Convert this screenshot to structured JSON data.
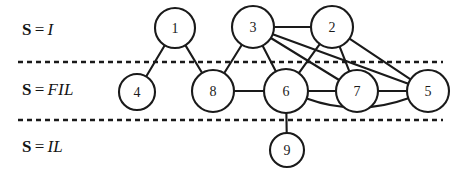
{
  "figure": {
    "type": "graph-diagram",
    "width": 467,
    "height": 173,
    "background_color": "#ffffff",
    "ink_color": "#1a1a1a"
  },
  "bands": [
    {
      "id": "band-i",
      "prefix": "S",
      "equals": "=",
      "value": "I",
      "label_x": 22,
      "label_y": 20
    },
    {
      "id": "band-fil",
      "prefix": "S",
      "equals": "=",
      "value": "FIL",
      "label_x": 22,
      "label_y": 80
    },
    {
      "id": "band-il",
      "prefix": "S",
      "equals": "=",
      "value": "IL",
      "label_x": 22,
      "label_y": 137
    }
  ],
  "dividers": [
    {
      "id": "divider-top",
      "x1": 18,
      "y1": 62,
      "x2": 443,
      "y2": 62
    },
    {
      "id": "divider-bottom",
      "x1": 18,
      "y1": 120,
      "x2": 443,
      "y2": 120
    }
  ],
  "nodes": [
    {
      "id": "1",
      "label": "1",
      "cx": 175,
      "cy": 28,
      "r": 20,
      "band": "band-i"
    },
    {
      "id": "3",
      "label": "3",
      "cx": 253,
      "cy": 27,
      "r": 21,
      "band": "band-i"
    },
    {
      "id": "2",
      "label": "2",
      "cx": 332,
      "cy": 27,
      "r": 21,
      "band": "band-i"
    },
    {
      "id": "4",
      "label": "4",
      "cx": 137,
      "cy": 92,
      "r": 18,
      "band": "band-fil"
    },
    {
      "id": "8",
      "label": "8",
      "cx": 213,
      "cy": 91,
      "r": 21,
      "band": "band-fil"
    },
    {
      "id": "6",
      "label": "6",
      "cx": 286,
      "cy": 91,
      "r": 22,
      "band": "band-fil"
    },
    {
      "id": "7",
      "label": "7",
      "cx": 357,
      "cy": 91,
      "r": 21,
      "band": "band-fil"
    },
    {
      "id": "5",
      "label": "5",
      "cx": 428,
      "cy": 91,
      "r": 21,
      "band": "band-fil"
    },
    {
      "id": "9",
      "label": "9",
      "cx": 287,
      "cy": 150,
      "r": 17,
      "band": "band-il"
    }
  ],
  "edges": [
    {
      "id": "edge-1-4",
      "from": "1",
      "to": "4",
      "shape": "straight"
    },
    {
      "id": "edge-1-8",
      "from": "1",
      "to": "8",
      "shape": "straight"
    },
    {
      "id": "edge-3-2",
      "from": "3",
      "to": "2",
      "shape": "straight"
    },
    {
      "id": "edge-3-8",
      "from": "3",
      "to": "8",
      "shape": "straight"
    },
    {
      "id": "edge-3-6",
      "from": "3",
      "to": "6",
      "shape": "straight"
    },
    {
      "id": "edge-3-7",
      "from": "3",
      "to": "7",
      "shape": "straight"
    },
    {
      "id": "edge-3-5",
      "from": "3",
      "to": "5",
      "shape": "straight"
    },
    {
      "id": "edge-2-6",
      "from": "2",
      "to": "6",
      "shape": "straight"
    },
    {
      "id": "edge-2-7",
      "from": "2",
      "to": "7",
      "shape": "straight"
    },
    {
      "id": "edge-2-5",
      "from": "2",
      "to": "5",
      "shape": "straight"
    },
    {
      "id": "edge-8-6",
      "from": "8",
      "to": "6",
      "shape": "straight"
    },
    {
      "id": "edge-6-7",
      "from": "6",
      "to": "7",
      "shape": "straight"
    },
    {
      "id": "edge-7-5",
      "from": "7",
      "to": "5",
      "shape": "straight"
    },
    {
      "id": "edge-6-5",
      "from": "6",
      "to": "5",
      "shape": "curved",
      "curve_offset": 26
    },
    {
      "id": "edge-6-9",
      "from": "6",
      "to": "9",
      "shape": "straight"
    }
  ]
}
